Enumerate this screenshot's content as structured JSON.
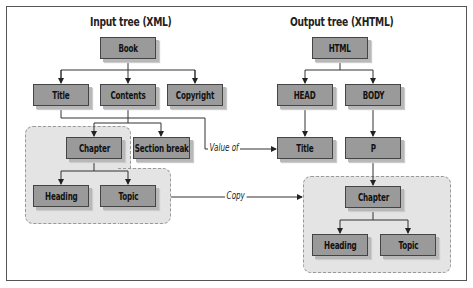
{
  "input_tree": {
    "title": "Input tree (XML)",
    "nodes": {
      "book": "Book",
      "title": "Title",
      "contents": "Contents",
      "copyright": "Copyright",
      "chapter": "Chapter",
      "section_break": "Section break",
      "heading": "Heading",
      "topic": "Topic"
    }
  },
  "output_tree": {
    "title": "Output tree (XHTML)",
    "nodes": {
      "html": "HTML",
      "head": "HEAD",
      "body": "BODY",
      "title": "Title",
      "p": "P",
      "chapter": "Chapter",
      "heading": "Heading",
      "topic": "Topic"
    }
  },
  "connectors": {
    "value_of": "Value of",
    "copy": "Copy"
  },
  "colors": {
    "node_fill": "#9a9a9a",
    "region_fill": "#e4e4e4",
    "line": "#333333"
  }
}
